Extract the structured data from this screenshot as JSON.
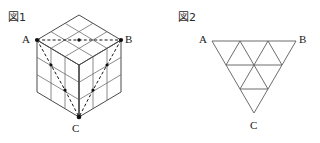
{
  "figures": [
    {
      "id": "fig1",
      "label": "図1",
      "type": "isometric-cube",
      "description": "3x3x3 cube drawn in isometric view with dashed path from A to B along the front-top edge and dashed diagonals descending to C",
      "divisions": 3,
      "vertices": [
        {
          "name": "A",
          "label": "A",
          "x": 37,
          "y": 40
        },
        {
          "name": "B",
          "label": "B",
          "x": 121,
          "y": 40
        },
        {
          "name": "C",
          "label": "C",
          "x": 79,
          "y": 117
        }
      ],
      "geometry": {
        "top_back": {
          "x": 79,
          "y": 15
        },
        "left_front_bottom": {
          "x": 37,
          "y": 92
        },
        "right_front_bottom": {
          "x": 121,
          "y": 92
        },
        "cell_dx": 14,
        "cell_dy": 8.3,
        "cell_h": 17.3
      },
      "markers": [
        {
          "x": 37,
          "y": 40
        },
        {
          "x": 79,
          "y": 40
        },
        {
          "x": 121,
          "y": 40
        },
        {
          "x": 79,
          "y": 117
        },
        {
          "x": 51,
          "y": 65
        },
        {
          "x": 107,
          "y": 65
        },
        {
          "x": 65,
          "y": 90
        },
        {
          "x": 93,
          "y": 90
        }
      ],
      "colors": {
        "grid": "#6d6d6d",
        "outline": "#4a4a4a",
        "dashed": "#151515"
      }
    },
    {
      "id": "fig2",
      "label": "図2",
      "type": "subdivided-triangle",
      "description": "Downward-pointing triangle subdivided into 9 congruent small triangles, 3 rows",
      "divisions": 3,
      "vertices": [
        {
          "name": "A",
          "label": "A",
          "x": 212,
          "y": 41
        },
        {
          "name": "B",
          "label": "B",
          "x": 296,
          "y": 41
        },
        {
          "name": "C",
          "label": "C",
          "x": 254,
          "y": 113
        }
      ],
      "colors": {
        "stroke": "#5c5c5c"
      }
    }
  ],
  "page": {
    "background": "#ffffff",
    "width": 320,
    "height": 143
  }
}
